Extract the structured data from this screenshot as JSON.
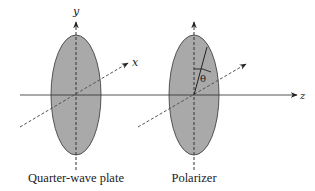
{
  "diagram": {
    "colors": {
      "plate_fill": "#a9a9a9",
      "plate_stroke": "#444444",
      "line": "#333333",
      "background": "#ffffff"
    },
    "axes": {
      "x_label": "x",
      "y_label": "y",
      "z_label": "z"
    },
    "angle_label": "θ",
    "elements": [
      {
        "name": "quarter-wave-plate",
        "caption": "Quarter-wave plate"
      },
      {
        "name": "polarizer",
        "caption": "Polarizer"
      }
    ]
  }
}
